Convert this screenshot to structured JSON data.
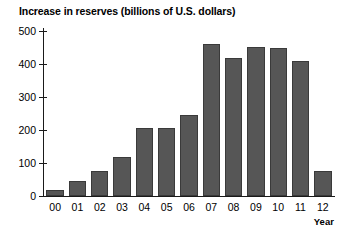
{
  "chart_data": {
    "type": "bar",
    "title": "Increase in reserves (billions of U.S. dollars)",
    "xlabel": "Year",
    "ylabel": "",
    "categories": [
      "00",
      "01",
      "02",
      "03",
      "04",
      "05",
      "06",
      "07",
      "08",
      "09",
      "10",
      "11",
      "12"
    ],
    "values": [
      18,
      47,
      75,
      118,
      205,
      207,
      245,
      462,
      418,
      452,
      448,
      408,
      75
    ],
    "ylim": [
      0,
      500
    ],
    "yticks": [
      0,
      100,
      200,
      300,
      400,
      500
    ],
    "ytick_labels": [
      "0",
      "100",
      "200",
      "300",
      "400",
      "500"
    ],
    "grid": false,
    "legend": null,
    "bar_color": "#565656",
    "bar_edge_color": "#3a3a3a",
    "axis_color": "#1a1a1a",
    "background_color": "#ffffff"
  }
}
